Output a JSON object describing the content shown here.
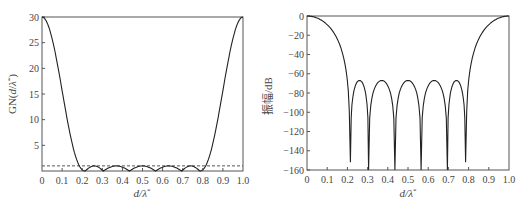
{
  "chart_data": [
    {
      "type": "line",
      "title": "",
      "xlabel": "d/λ*",
      "ylabel": "GN(d/λ*)",
      "xlim": [
        0,
        1.0
      ],
      "ylim": [
        0,
        30
      ],
      "x_ticks": [
        "0",
        "0.1",
        "0.2",
        "0.3",
        "0.4",
        "0.5",
        "0.6",
        "0.7",
        "0.8",
        "0.9",
        "1.0"
      ],
      "y_ticks": [
        "5",
        "10",
        "15",
        "20",
        "25",
        "30"
      ],
      "grid": false,
      "series": [
        {
          "name": "GN(d/λ*)",
          "style": "solid",
          "x": [
            0,
            0.02,
            0.04,
            0.06,
            0.08,
            0.1,
            0.12,
            0.14,
            0.16,
            0.18,
            0.2,
            0.215,
            0.25,
            0.305,
            0.37,
            0.435,
            0.5,
            0.565,
            0.63,
            0.695,
            0.75,
            0.785,
            0.8,
            0.82,
            0.84,
            0.86,
            0.88,
            0.9,
            0.92,
            0.94,
            0.96,
            0.98,
            1.0
          ],
          "values": [
            30,
            29.3,
            27.5,
            24.6,
            20.9,
            16.8,
            12.6,
            8.6,
            5.2,
            2.5,
            0.7,
            0,
            1.0,
            0,
            1.0,
            0,
            1.0,
            0,
            1.0,
            0,
            1.0,
            0,
            0.7,
            2.5,
            5.2,
            8.6,
            12.6,
            16.8,
            20.9,
            24.6,
            27.5,
            29.3,
            30
          ]
        },
        {
          "name": "ripple level",
          "style": "dashed",
          "x": [
            0,
            1.0
          ],
          "values": [
            1.0,
            1.0
          ]
        }
      ]
    },
    {
      "type": "line",
      "title": "",
      "xlabel": "d/λ*",
      "ylabel": "振幅/dB",
      "xlim": [
        0,
        1.0
      ],
      "ylim": [
        -160,
        0
      ],
      "x_ticks": [
        "0",
        "0.1",
        "0.2",
        "0.3",
        "0.4",
        "0.5",
        "0.6",
        "0.7",
        "0.8",
        "0.9",
        "1.0"
      ],
      "y_ticks": [
        "0",
        "-20",
        "-40",
        "-60",
        "-80",
        "-100",
        "-120",
        "-140",
        "-160"
      ],
      "grid": false,
      "nulls": [
        0.215,
        0.305,
        0.435,
        0.565,
        0.695,
        0.785
      ],
      "null_depths": [
        -152,
        -160,
        -160,
        -160,
        -160,
        -152
      ],
      "sidelobe_peaks": [
        {
          "x": 0.25,
          "y": -67
        },
        {
          "x": 0.37,
          "y": -67
        },
        {
          "x": 0.5,
          "y": -67
        },
        {
          "x": 0.63,
          "y": -67
        },
        {
          "x": 0.75,
          "y": -67
        }
      ],
      "series": [
        {
          "name": "振幅",
          "x": [
            0,
            0.02,
            0.05,
            0.08,
            0.1,
            0.12,
            0.14,
            0.16,
            0.18,
            0.2,
            0.21,
            0.215,
            0.25,
            0.305,
            0.37,
            0.435,
            0.5,
            0.565,
            0.63,
            0.695,
            0.75,
            0.785,
            0.79,
            0.8,
            0.82,
            0.84,
            0.86,
            0.88,
            0.9,
            0.92,
            0.95,
            0.98,
            1.0
          ],
          "values": [
            0,
            -0.3,
            -2,
            -5.5,
            -9,
            -14,
            -21,
            -30,
            -43,
            -62,
            -85,
            -152,
            -67,
            -160,
            -67,
            -160,
            -67,
            -160,
            -67,
            -160,
            -67,
            -152,
            -85,
            -62,
            -43,
            -30,
            -21,
            -14,
            -9,
            -5.5,
            -2,
            -0.3,
            0
          ]
        }
      ]
    }
  ],
  "left_chart": {
    "ylabel": "GN(d/λ*)",
    "xlabel_italic": "d/λ",
    "xlabel_sup": "*"
  },
  "right_chart": {
    "ylabel": "振幅/dB",
    "xlabel_italic": "d/λ",
    "xlabel_sup": "*"
  }
}
